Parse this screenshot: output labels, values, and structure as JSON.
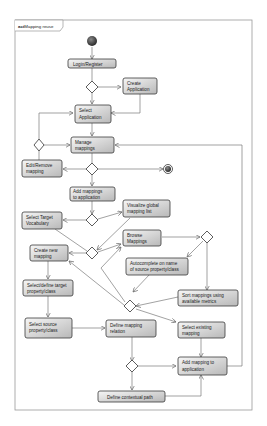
{
  "frame": {
    "keyword": "act",
    "title": "Mapping reuse"
  },
  "colors": {
    "node_fill_top": "#f4f4f4",
    "node_fill_bottom": "#bdbdbd",
    "node_stroke": "#3a3a3a",
    "line": "#7a7a7a",
    "frame": "#9a9a9a",
    "start": "#333333"
  },
  "nodes": {
    "login": {
      "lines": [
        "Login/Register"
      ]
    },
    "create_app": {
      "lines": [
        "Create",
        "Application"
      ]
    },
    "select_app": {
      "lines": [
        "Select",
        "Application"
      ]
    },
    "manage": {
      "lines": [
        "Manage",
        "mappings"
      ]
    },
    "edit_remove": {
      "lines": [
        "Edit/Remove",
        "mapping"
      ]
    },
    "add_to_app": {
      "lines": [
        "Add mappings",
        "to application"
      ]
    },
    "visualize": {
      "lines": [
        "Visualize global",
        "mapping list"
      ]
    },
    "select_vocab": {
      "lines": [
        "Select Target",
        "Vocabulary"
      ]
    },
    "browse": {
      "lines": [
        "Browse",
        "Mappings"
      ]
    },
    "create_new": {
      "lines": [
        "Create new",
        "mapping"
      ]
    },
    "autocomplete": {
      "lines": [
        "Autocomplete on name",
        "of source property/class"
      ]
    },
    "select_target": {
      "lines": [
        "Select/define target",
        "property/class"
      ]
    },
    "sort": {
      "lines": [
        "Sort mappings using",
        "available metrics"
      ]
    },
    "select_source": {
      "lines": [
        "Select source",
        "property/class"
      ]
    },
    "define_rel": {
      "lines": [
        "Define mapping",
        "relation"
      ]
    },
    "select_exist": {
      "lines": [
        "Select existing",
        "mapping"
      ]
    },
    "add_mapping": {
      "lines": [
        "Add mapping to",
        "application"
      ]
    },
    "context_path": {
      "lines": [
        "Define contextual path"
      ]
    }
  }
}
